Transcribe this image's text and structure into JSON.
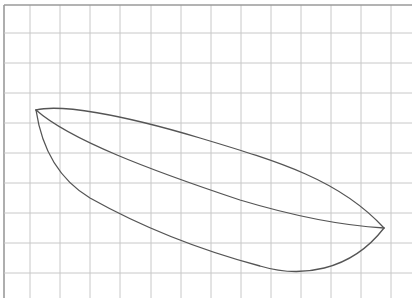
{
  "diagram": {
    "type": "sketch-on-grid",
    "colors": {
      "background": "#ffffff",
      "grid": "#c8c8c8",
      "border": "#9a9a9a",
      "stroke": "#555555"
    },
    "grid": {
      "vertical_lines_x": [
        4,
        30,
        60,
        90,
        120,
        151,
        181,
        211,
        241,
        271,
        301,
        331,
        361,
        391
      ],
      "horizontal_lines_y": [
        5,
        33,
        63,
        93,
        123,
        153,
        183,
        213,
        243,
        273
      ]
    },
    "shape": {
      "left_tip": [
        36,
        110
      ],
      "right_tip": [
        384,
        228
      ],
      "curves": [
        {
          "name": "upper-edge",
          "d": "M36,110 C60,104 120,114 200,138 C280,162 340,180 384,228"
        },
        {
          "name": "middle-diagonal",
          "d": "M36,110 C70,140 150,170 240,200 C300,218 350,226 384,228"
        },
        {
          "name": "lower-edge",
          "d": "M36,110 C42,150 60,180 90,198 C140,226 200,250 260,266 C300,278 350,272 384,228"
        }
      ]
    }
  }
}
